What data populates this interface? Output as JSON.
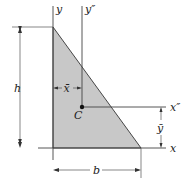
{
  "diagram": {
    "type": "triangle-centroid",
    "shape": {
      "name": "right triangle",
      "fill_color": "#c8c8c8",
      "edge_color": "#333333"
    },
    "axes": {
      "y": "y",
      "y_double_prime": "y″",
      "x": "x",
      "x_double_prime": "x″"
    },
    "centroid": {
      "label": "C"
    },
    "dimensions": {
      "height": "h",
      "base": "b",
      "x_bar": "x̄",
      "y_bar": "ȳ"
    }
  }
}
